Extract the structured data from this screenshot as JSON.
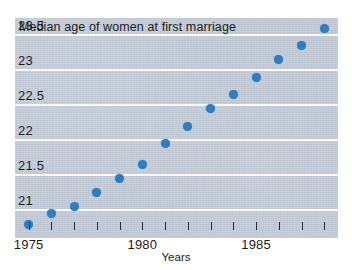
{
  "chart_data": {
    "type": "scatter",
    "title": "Median age of women at first marriage",
    "xlabel": "Years",
    "ylabel": "",
    "xlim": [
      1974.4,
      1988.6
    ],
    "ylim": [
      20.6,
      23.75
    ],
    "grid": true,
    "legend": null,
    "marker_color": "#2f7cc0",
    "plot_background": "#c3ccd9",
    "gridline_color": "#ffffff",
    "y_ticks": [
      {
        "value": 21,
        "label": "21"
      },
      {
        "value": 21.5,
        "label": "21.5"
      },
      {
        "value": 22,
        "label": "22"
      },
      {
        "value": 22.5,
        "label": "22.5"
      },
      {
        "value": 23,
        "label": "23"
      },
      {
        "value": 23.5,
        "label": "23.5"
      }
    ],
    "x_ticks": [
      {
        "value": 1975,
        "label": "1975"
      },
      {
        "value": 1976,
        "label": ""
      },
      {
        "value": 1977,
        "label": ""
      },
      {
        "value": 1978,
        "label": ""
      },
      {
        "value": 1979,
        "label": ""
      },
      {
        "value": 1980,
        "label": "1980"
      },
      {
        "value": 1981,
        "label": ""
      },
      {
        "value": 1982,
        "label": ""
      },
      {
        "value": 1983,
        "label": ""
      },
      {
        "value": 1984,
        "label": ""
      },
      {
        "value": 1985,
        "label": "1985"
      },
      {
        "value": 1986,
        "label": ""
      },
      {
        "value": 1987,
        "label": ""
      },
      {
        "value": 1988,
        "label": ""
      }
    ],
    "x": [
      1975,
      1976,
      1977,
      1978,
      1979,
      1980,
      1981,
      1982,
      1983,
      1984,
      1985,
      1986,
      1987,
      1988
    ],
    "values": [
      20.8,
      20.95,
      21.05,
      21.25,
      21.45,
      21.65,
      21.95,
      22.2,
      22.45,
      22.65,
      22.9,
      23.15,
      23.35,
      23.6
    ]
  }
}
